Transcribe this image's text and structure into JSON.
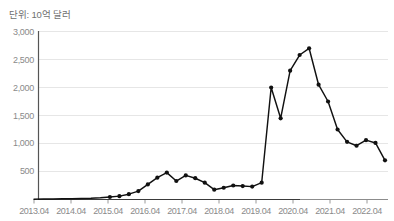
{
  "chart_data": {
    "type": "line",
    "title": "단위: 10억 달러",
    "xlabel": "",
    "ylabel": "",
    "ylim": [
      0,
      3000
    ],
    "ytick_values": [
      0,
      500,
      1000,
      1500,
      2000,
      2500,
      3000
    ],
    "ytick_labels": [
      "0",
      "500",
      "1,000",
      "1,500",
      "2,000",
      "2,500",
      "3,000"
    ],
    "ytick_labels_shown": [
      "500",
      "1,000",
      "1,500",
      "2,000",
      "2,500",
      "3,000"
    ],
    "xtick_labels": [
      "2013.04",
      "2014.04",
      "2015.04",
      "2016.04",
      "2017.04",
      "2018.04",
      "2019.04",
      "2020.04",
      "2021.04",
      "2022.04"
    ],
    "grid": "horizontal",
    "legend": "none",
    "line_color": "#111111",
    "marker": "circle",
    "marker_color": "#111111",
    "grid_color": "#e6e6e6",
    "axis_color": "#333333",
    "tick_text_color": "#8a8a8a",
    "title_color": "#6f6f6f",
    "series": [
      {
        "name": "value",
        "x": [
          "2013.04",
          "2013.10",
          "2014.04",
          "2014.10",
          "2015.04",
          "2015.10",
          "2016.04",
          "2016.10",
          "2017.01",
          "2017.04",
          "2017.07",
          "2017.10",
          "2018.01",
          "2018.04",
          "2018.07",
          "2018.10",
          "2019.01",
          "2019.04",
          "2019.07",
          "2019.10",
          "2020.01",
          "2020.04",
          "2020.07",
          "2020.10",
          "2021.01",
          "2021.04",
          "2021.07",
          "2021.10",
          "2022.01",
          "2022.04",
          "2022.07",
          "2022.10"
        ],
        "values": [
          5,
          8,
          10,
          12,
          14,
          18,
          22,
          30,
          45,
          60,
          95,
          150,
          270,
          390,
          480,
          330,
          430,
          380,
          300,
          175,
          210,
          250,
          240,
          230,
          300,
          2000,
          1450,
          2300,
          2580,
          2700,
          2050,
          1750
        ],
        "values_tail": [
          1250,
          1030,
          960,
          1060,
          1010,
          700
        ]
      }
    ],
    "peak_value": 2700,
    "end_value": 700
  }
}
